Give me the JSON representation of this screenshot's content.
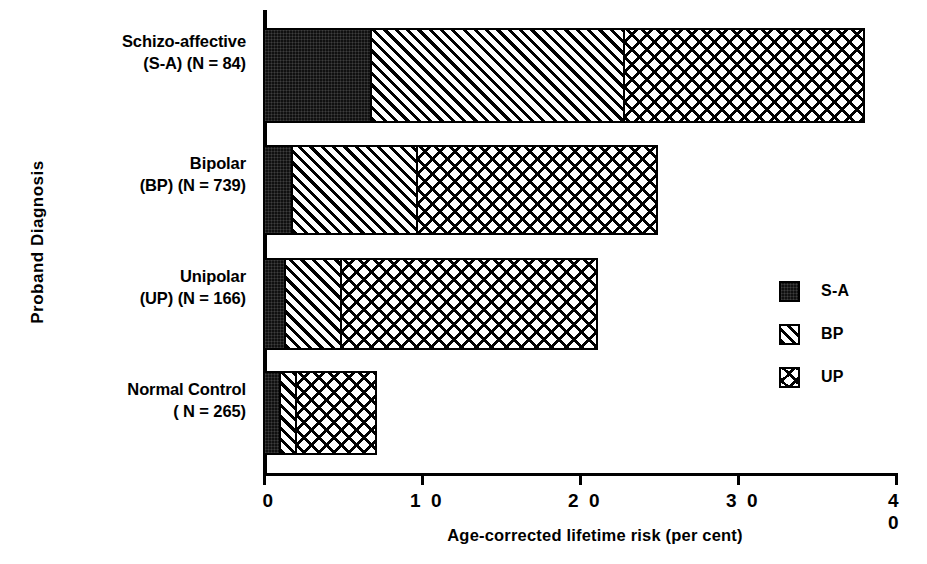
{
  "chart_data": {
    "type": "bar",
    "orientation": "horizontal",
    "stacked": true,
    "title": "",
    "xlabel": "Age-corrected lifetime risk (per cent)",
    "ylabel": "Proband Diagnosis",
    "xlim": [
      0,
      40
    ],
    "xticks": [
      0,
      10,
      20,
      30,
      40
    ],
    "xtick_labels": [
      "0",
      "1 0",
      "2 0",
      "3 0",
      "4 0"
    ],
    "grid": false,
    "legend_position": "right-middle",
    "categories": [
      "Schizo-affective (S-A) (N = 84)",
      "Bipolar (BP) (N = 739)",
      "Unipolar (UP) (N = 166)",
      "Normal Control ( N = 265)"
    ],
    "series": [
      {
        "name": "S-A",
        "values": [
          6.8,
          1.8,
          1.3,
          1.0
        ]
      },
      {
        "name": "BP",
        "values": [
          16.0,
          7.9,
          3.6,
          1.0
        ]
      },
      {
        "name": "UP",
        "values": [
          15.2,
          15.2,
          16.2,
          5.1
        ]
      }
    ],
    "cumulative_totals": [
      38.0,
      24.9,
      21.1,
      7.1
    ]
  },
  "y_axis": {
    "title": "Proband Diagnosis",
    "categories": [
      {
        "line1": "Schizo-affective",
        "line2": "(S-A) (N = 84)"
      },
      {
        "line1": "Bipolar",
        "line2": "(BP) (N = 739)"
      },
      {
        "line1": "Unipolar",
        "line2": "(UP) (N = 166)"
      },
      {
        "line1": "Normal Control",
        "line2": "( N = 265)"
      }
    ]
  },
  "x_axis": {
    "title": "Age-corrected lifetime risk (per cent)",
    "ticks": [
      {
        "label": "0",
        "value": 0
      },
      {
        "label": "1 0",
        "value": 10
      },
      {
        "label": "2 0",
        "value": 20
      },
      {
        "label": "3 0",
        "value": 30
      },
      {
        "label": "4 0",
        "value": 40
      }
    ]
  },
  "legend": {
    "items": [
      {
        "label": "S-A",
        "pattern": "solid-black",
        "swatch_icon": "legend-swatch-solid-icon"
      },
      {
        "label": "BP",
        "pattern": "diagonal-hatch",
        "swatch_icon": "legend-swatch-hatch-icon"
      },
      {
        "label": "UP",
        "pattern": "cross-dash",
        "swatch_icon": "legend-swatch-crossdash-icon"
      }
    ]
  },
  "colors": {
    "ink": "#000000",
    "paper": "#ffffff"
  }
}
